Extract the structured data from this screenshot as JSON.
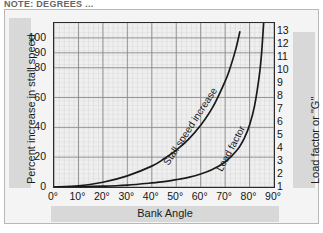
{
  "top_cropped_text": "NOTE: DEGREES ...",
  "chart_data": {
    "type": "line",
    "title": "",
    "xlabel": "Bank Angle",
    "ylabel": "Percent increase in stall speed",
    "y2label": "Load factor or \"G\"",
    "xlim": [
      0,
      90
    ],
    "ylim": [
      0,
      110
    ],
    "y2lim": [
      1,
      13.6
    ],
    "grid": true,
    "legend": "inline-curve-labels",
    "x_ticks": [
      "0°",
      "10°",
      "20°",
      "30°",
      "40°",
      "50°",
      "60°",
      "70°",
      "80°",
      "90°"
    ],
    "x_tick_values": [
      0,
      10,
      20,
      30,
      40,
      50,
      60,
      70,
      80,
      90
    ],
    "y_ticks": [
      "0",
      "20",
      "40",
      "60",
      "80",
      "90",
      "100"
    ],
    "y_tick_values": [
      0,
      20,
      40,
      60,
      80,
      90,
      100
    ],
    "y2_ticks": [
      "1",
      "2",
      "3",
      "4",
      "5",
      "6",
      "7",
      "8",
      "9",
      "10",
      "11",
      "12",
      "13"
    ],
    "y2_tick_values": [
      1,
      2,
      3,
      4,
      5,
      6,
      7,
      8,
      9,
      10,
      11,
      12,
      13
    ],
    "series": [
      {
        "name": "Stall speed increase",
        "axis": "left",
        "color": "#1a1a1a",
        "x": [
          0,
          10,
          20,
          30,
          40,
          45,
          50,
          55,
          60,
          65,
          70,
          72,
          74,
          75,
          76
        ],
        "values": [
          0,
          0.8,
          3.2,
          7.5,
          14.0,
          18.9,
          24.7,
          32.0,
          41.4,
          53.7,
          70.9,
          79.6,
          90.3,
          96.6,
          104.0
        ]
      },
      {
        "name": "Load factor",
        "axis": "right",
        "color": "#1a1a1a",
        "x": [
          0,
          10,
          20,
          30,
          40,
          45,
          50,
          55,
          60,
          65,
          70,
          75,
          78,
          80,
          82,
          84,
          85,
          86
        ],
        "values": [
          1.0,
          1.02,
          1.06,
          1.15,
          1.31,
          1.41,
          1.56,
          1.74,
          2.0,
          2.37,
          2.92,
          3.86,
          4.81,
          5.76,
          7.19,
          9.57,
          11.47,
          14.34
        ]
      }
    ],
    "annotations": [
      {
        "text": "Stall speed increase",
        "kind": "curve-label"
      },
      {
        "text": "Load factor",
        "kind": "curve-label"
      }
    ]
  }
}
